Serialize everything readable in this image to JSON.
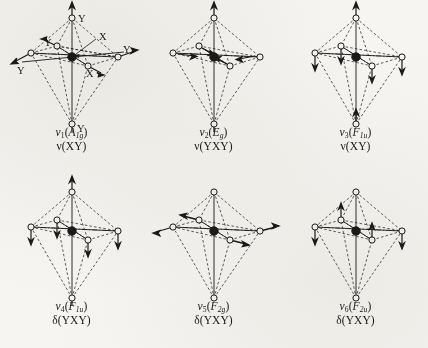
{
  "figure": {
    "background_color": "#f6f5f2",
    "ink_color": "#1a1a1a",
    "columns": 3,
    "rows": 2
  },
  "atom_labels": {
    "central": "X",
    "ligand": "Y"
  },
  "modes": [
    {
      "id": "nu1",
      "symbol": "ν",
      "index": "1",
      "symmetry_open": "(",
      "symmetry": "A",
      "symmetry_sub": "1g",
      "symmetry_close": ")",
      "coordinate": "ν(XY)",
      "caption_line1": "ν₁(A₁₉)",
      "caption_line2": "ν(XY)",
      "vertex_labels": [
        "Y",
        "Y",
        "Y",
        "Y",
        "Y",
        "Y"
      ],
      "center_label": "X",
      "description": "symmetric stretch — all six Y atoms move outward"
    },
    {
      "id": "nu2",
      "symbol": "ν",
      "index": "2",
      "symmetry_open": "(",
      "symmetry": "E",
      "symmetry_sub": "g",
      "symmetry_close": ")",
      "coordinate": "ν(YXY)",
      "caption_line1": "ν₂(E₉)",
      "caption_line2": "ν(YXY)",
      "description": "axial Y atoms move outward, equatorial Y atoms move inward"
    },
    {
      "id": "nu3",
      "symbol": "ν",
      "index": "3",
      "symmetry_open": "(",
      "symmetry": "F",
      "symmetry_sub": "1u",
      "symmetry_close": ")",
      "coordinate": "ν(XY)",
      "caption_line1": "ν₃(F₁ᵤ)",
      "caption_line2": "ν(XY)",
      "description": "antisymmetric stretch — axial atoms up, equatorial atoms down"
    },
    {
      "id": "nu4",
      "symbol": "ν",
      "index": "4",
      "symmetry_open": "(",
      "symmetry": "F",
      "symmetry_sub": "1u",
      "symmetry_close": ")",
      "coordinate": "δ(YXY)",
      "caption_line1": "ν₄(F₁ᵤ)",
      "caption_line2": "δ(YXY)",
      "description": "bending — axial up, equatorial atoms down"
    },
    {
      "id": "nu5",
      "symbol": "ν",
      "index": "5",
      "symmetry_open": "(",
      "symmetry": "F",
      "symmetry_sub": "2g",
      "symmetry_close": ")",
      "coordinate": "δ(YXY)",
      "caption_line1": "ν₅(F₂₉)",
      "caption_line2": "δ(YXY)",
      "description": "bending — equatorial atoms move horizontally"
    },
    {
      "id": "nu6",
      "symbol": "ν",
      "index": "6",
      "symmetry_open": "(",
      "symmetry": "F",
      "symmetry_sub": "2u",
      "symmetry_close": ")",
      "coordinate": "δ(YXY)",
      "caption_line1": "ν₆(F₂ᵤ)",
      "caption_line2": "δ(YXY)",
      "description": "bending — alternating vertical displacement of equatorial atoms"
    }
  ]
}
